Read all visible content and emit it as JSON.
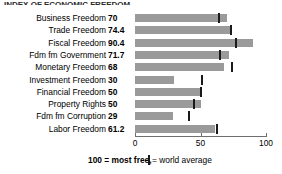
{
  "title_sliver": "INDEX OF ECONOMIC FREEDOM",
  "chart_data": {
    "type": "bar",
    "orientation": "horizontal",
    "title": "",
    "xlabel": "",
    "ylabel": "",
    "xlim": [
      0,
      100
    ],
    "xticks": [
      0,
      50,
      100
    ],
    "xtick_labels": [
      "0",
      "50",
      "100"
    ],
    "grid": false,
    "bar_color": "#9a9a9a",
    "marker_color": "#1a1a1a",
    "categories": [
      "Business Freedom",
      "Trade Freedom",
      "Fiscal Freedom",
      "Fdm fm Government",
      "Monetary Freedom",
      "Investment Freedom",
      "Financial Freedom",
      "Property Rights",
      "Fdm fm Corruption",
      "Labor Freedom"
    ],
    "values": [
      70,
      74.4,
      90.4,
      71.7,
      68,
      30,
      50,
      50,
      29,
      61.2
    ],
    "value_labels": [
      "70",
      "74.4",
      "90.4",
      "71.7",
      "68",
      "30",
      "50",
      "50",
      "29",
      "61.2"
    ],
    "series": [
      {
        "name": "Score",
        "values": [
          70,
          74.4,
          90.4,
          71.7,
          68,
          30,
          50,
          50,
          29,
          61.2
        ]
      },
      {
        "name": "World average",
        "type": "marker",
        "values": [
          63,
          72.5,
          76.5,
          64.5,
          73.5,
          50,
          49.5,
          44,
          40.5,
          62
        ]
      }
    ],
    "legend": {
      "position": "bottom",
      "entries": [
        {
          "label": "100 = most free,",
          "kind": "note"
        },
        {
          "label": "= world average",
          "kind": "marker"
        }
      ]
    }
  },
  "legend": {
    "most_free": "100 = most free,",
    "world_average": "= world average"
  }
}
